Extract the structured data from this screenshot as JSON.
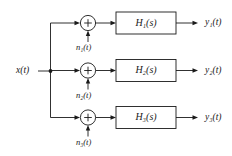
{
  "diagram": {
    "type": "block-diagram",
    "colors": {
      "line": "#1a1a1a",
      "background": "#ffffff",
      "block_fill": "#ffffff"
    },
    "input": {
      "label": "x(t)",
      "base": "x",
      "arg": "(t)"
    },
    "branches": [
      {
        "index": 1,
        "sum_sign": "+",
        "noise": {
          "base": "n",
          "subscript": "1",
          "arg": "(t)",
          "label": "n₁(t)"
        },
        "block": {
          "base": "H",
          "subscript": "1",
          "arg": "(s)",
          "label": "H₁(s)"
        },
        "output": {
          "base": "y",
          "subscript": "1",
          "arg": "(t)",
          "label": "y₁(t)"
        }
      },
      {
        "index": 2,
        "sum_sign": "+",
        "noise": {
          "base": "n",
          "subscript": "2",
          "arg": "(t)",
          "label": "n₂(t)"
        },
        "block": {
          "base": "H",
          "subscript": "2",
          "arg": "(s)",
          "label": "H₂(s)"
        },
        "output": {
          "base": "y",
          "subscript": "2",
          "arg": "(t)",
          "label": "y₂(t)"
        }
      },
      {
        "index": 3,
        "sum_sign": "+",
        "noise": {
          "base": "n",
          "subscript": "3",
          "arg": "(t)",
          "label": "n₃(t)"
        },
        "block": {
          "base": "H",
          "subscript": "3",
          "arg": "(s)",
          "label": "H₃(s)"
        },
        "output": {
          "base": "y",
          "subscript": "3",
          "arg": "(t)",
          "label": "y₃(t)"
        }
      }
    ]
  }
}
